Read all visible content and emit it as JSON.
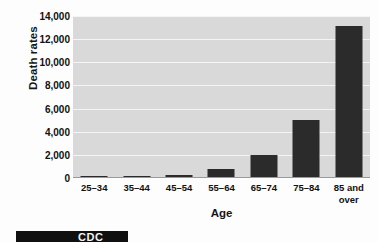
{
  "chart_data": {
    "type": "bar",
    "title": "",
    "subtitle": "",
    "xlabel": "Age",
    "ylabel": "Death rates",
    "categories": [
      "25–34",
      "35–44",
      "45–54",
      "55–64",
      "65–74",
      "75–84",
      "85 and over"
    ],
    "values": [
      50,
      110,
      260,
      750,
      1950,
      5000,
      13100
    ],
    "ylim": [
      0,
      14000
    ],
    "ytick_labels": [
      "0",
      "2,000",
      "4,000",
      "6,000",
      "8,000",
      "10,000",
      "12,000",
      "14,000"
    ],
    "ytick_values": [
      0,
      2000,
      4000,
      6000,
      8000,
      10000,
      12000,
      14000
    ],
    "grid": true,
    "grid_orientation": "horizontal",
    "legend": false,
    "legend_position": "none",
    "series": [
      {
        "name": "Death rates",
        "values": [
          50,
          110,
          260,
          750,
          1950,
          5000,
          13100
        ]
      }
    ],
    "annotations": []
  },
  "axes": {
    "y_title": "Death rates",
    "x_title": "Age"
  },
  "x_labels": [
    {
      "line1": "25–34",
      "line2": ""
    },
    {
      "line1": "35–44",
      "line2": ""
    },
    {
      "line1": "45–54",
      "line2": ""
    },
    {
      "line1": "55–64",
      "line2": ""
    },
    {
      "line1": "65–74",
      "line2": ""
    },
    {
      "line1": "75–84",
      "line2": ""
    },
    {
      "line1": "85 and",
      "line2": "over"
    }
  ],
  "colors": {
    "bar": "#2b2b2b",
    "plot_background": "#d9d9d9",
    "gridline": "#f4f4f4",
    "axis_line": "#9a9a9a",
    "text": "#111111",
    "page_background": "#fdfdfd",
    "banner_background": "#101010",
    "banner_text": "#f2f2f2"
  },
  "footer_banner": {
    "text": "CDC"
  }
}
